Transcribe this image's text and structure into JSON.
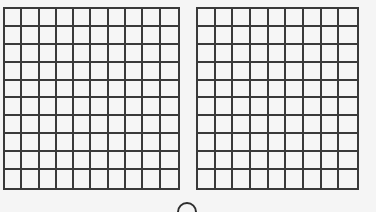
{
  "figure": {
    "grids": [
      {
        "name": "left-grid",
        "rows": 10,
        "cols": 10,
        "shaded_cells": []
      },
      {
        "name": "right-grid",
        "rows": 10,
        "cols": 9,
        "shaded_cells": []
      }
    ],
    "colors": {
      "line": "#3a3a3a",
      "background": "#f5f5f5"
    },
    "bottom_marker": {
      "shape": "circle",
      "label": ""
    }
  }
}
